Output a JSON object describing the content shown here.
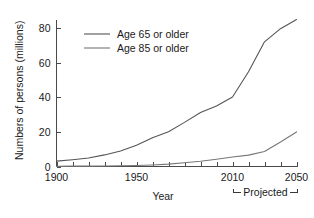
{
  "chart_data": {
    "type": "line",
    "title": "",
    "xlabel": "Year",
    "ylabel": "Numbers of persons (millions)",
    "xlim": [
      1900,
      2050
    ],
    "ylim": [
      0,
      85
    ],
    "grid": false,
    "legend_position": "top-left",
    "x_tick_labels": [
      "1900",
      "1950",
      "2010",
      "2050"
    ],
    "x_tick_values": [
      1900,
      1950,
      2010,
      2050
    ],
    "x_minor_ticks": [
      1910,
      1920,
      1930,
      1940,
      1960,
      1970,
      1980,
      1990,
      2000,
      2020,
      2030,
      2040
    ],
    "y_tick_labels": [
      "0",
      "20",
      "40",
      "60",
      "80"
    ],
    "y_tick_values": [
      0,
      20,
      40,
      60,
      80
    ],
    "x": [
      1900,
      1910,
      1920,
      1930,
      1940,
      1950,
      1960,
      1970,
      1980,
      1990,
      2000,
      2010,
      2020,
      2030,
      2040,
      2050
    ],
    "series": [
      {
        "name": "Age 65 or older",
        "color": "#555555",
        "values": [
          3.1,
          3.9,
          4.9,
          6.7,
          9.0,
          12.3,
          16.6,
          20.1,
          25.5,
          31.2,
          35.0,
          40.2,
          54.8,
          72.1,
          79.7,
          85.0
        ]
      },
      {
        "name": "Age 85 or older",
        "color": "#777777",
        "values": [
          0.1,
          0.2,
          0.2,
          0.3,
          0.4,
          0.6,
          0.9,
          1.4,
          2.2,
          3.0,
          4.2,
          5.5,
          6.6,
          8.7,
          14.2,
          20.0
        ]
      }
    ],
    "annotations": [
      {
        "name": "projected-bracket",
        "label": "Projected",
        "from_x": 2010,
        "to_x": 2050
      }
    ]
  },
  "legend": {
    "entries": [
      {
        "label": "Age 65 or older"
      },
      {
        "label": "Age 85 or older"
      }
    ]
  },
  "axes": {
    "x_title": "Year",
    "y_title": "Numbers of persons (millions)"
  },
  "colors": {
    "axis": "#4a4a4a",
    "text": "#1a1a1a",
    "series_65": "#555555",
    "series_85": "#777777",
    "background": "#ffffff"
  }
}
